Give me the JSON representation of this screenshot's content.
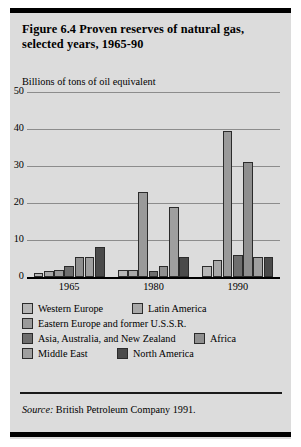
{
  "figure": {
    "title": "Figure 6.4  Proven reserves of natural gas, selected years, 1965-90",
    "axis_label": "Billions of tons of oil equivalent",
    "source_prefix": "Source:",
    "source_text": "British Petroleum Company 1991."
  },
  "colors": {
    "panel_background": "#dcdcdc",
    "gridline": "#8c8c8c",
    "bar_outline": "#2b2b2b",
    "western_europe": "#b6b6b6",
    "latin_america": "#a8a8a8",
    "eastern_europe_ussr": "#9a9a9a",
    "asia_australia_nz": "#6e6e6e",
    "africa": "#8f8f8f",
    "middle_east": "#9f9f9f",
    "north_america": "#4a4a4a"
  },
  "chart_data": {
    "type": "bar",
    "title": "Figure 6.4  Proven reserves of natural gas, selected years, 1965-90",
    "xlabel": "",
    "ylabel": "Billions of tons of oil equivalent",
    "categories": [
      "1965",
      "1980",
      "1990"
    ],
    "ylim": [
      0,
      50
    ],
    "yticks": [
      0,
      10,
      20,
      30,
      40,
      50
    ],
    "grid": true,
    "legend_position": "below",
    "series": [
      {
        "name": "Western Europe",
        "color": "#b6b6b6",
        "values": [
          1.0,
          2.0,
          3.0
        ]
      },
      {
        "name": "Latin America",
        "color": "#a8a8a8",
        "values": [
          1.5,
          2.0,
          4.5
        ]
      },
      {
        "name": "Eastern Europe and former U.S.S.R.",
        "color": "#9a9a9a",
        "values": [
          2.0,
          23.0,
          39.5
        ]
      },
      {
        "name": "Asia, Australia, and New Zealand",
        "color": "#6e6e6e",
        "values": [
          3.0,
          1.5,
          6.0
        ]
      },
      {
        "name": "Africa",
        "color": "#8f8f8f",
        "values": [
          5.5,
          3.0,
          31.0
        ]
      },
      {
        "name": "Middle East",
        "color": "#9f9f9f",
        "values": [
          5.5,
          19.0,
          5.5
        ]
      },
      {
        "name": "North America",
        "color": "#4a4a4a",
        "values": [
          8.0,
          5.5,
          5.5
        ]
      }
    ]
  },
  "legend": [
    {
      "label": "Western Europe",
      "color": "#b6b6b6"
    },
    {
      "label": "Latin America",
      "color": "#a8a8a8"
    },
    {
      "label": "Eastern Europe and former U.S.S.R.",
      "color": "#9a9a9a"
    },
    {
      "label": "Asia, Australia, and New Zealand",
      "color": "#6e6e6e"
    },
    {
      "label": "Africa",
      "color": "#8f8f8f"
    },
    {
      "label": "Middle East",
      "color": "#9f9f9f"
    },
    {
      "label": "North America",
      "color": "#4a4a4a"
    }
  ]
}
